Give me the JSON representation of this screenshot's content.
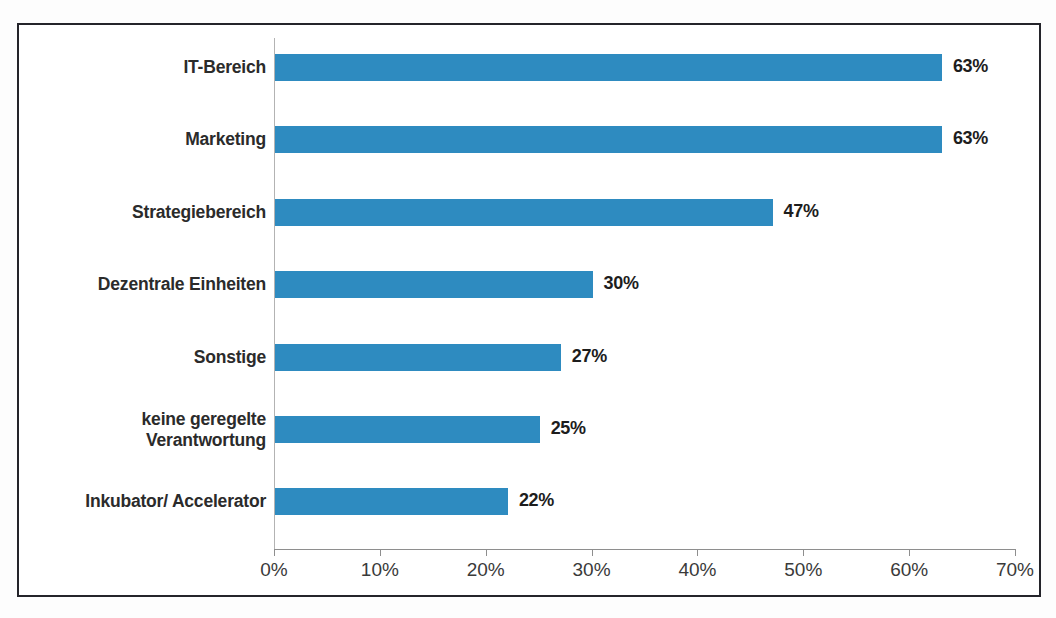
{
  "chart_data": {
    "type": "bar",
    "orientation": "horizontal",
    "title": "",
    "subtitle": "",
    "xlabel": "",
    "ylabel": "",
    "xlim": [
      0,
      70
    ],
    "grid": false,
    "legend": false,
    "bar_color": "#2e8bc0",
    "axis_color": "#8e8e8e",
    "frame_color": "#24242a",
    "value_suffix": "%",
    "categories": [
      "IT-Bereich",
      "Marketing",
      "Strategiebereich",
      "Dezentrale Einheiten",
      "Sonstige",
      "keine geregelte\nVerantwortung",
      "Inkubator/ Accelerator"
    ],
    "values": [
      63,
      63,
      47,
      30,
      27,
      25,
      22
    ],
    "value_labels": [
      "63%",
      "63%",
      "47%",
      "30%",
      "27%",
      "25%",
      "22%"
    ],
    "xticks": [
      0,
      10,
      20,
      30,
      40,
      50,
      60,
      70
    ],
    "xtick_labels": [
      "0%",
      "10%",
      "20%",
      "30%",
      "40%",
      "50%",
      "60%",
      "70%"
    ]
  },
  "rows": [
    {
      "label_line1": "IT-Bereich",
      "label_line2": "",
      "value_label": "63%"
    },
    {
      "label_line1": "Marketing",
      "label_line2": "",
      "value_label": "63%"
    },
    {
      "label_line1": "Strategiebereich",
      "label_line2": "",
      "value_label": "47%"
    },
    {
      "label_line1": "Dezentrale Einheiten",
      "label_line2": "",
      "value_label": "30%"
    },
    {
      "label_line1": "Sonstige",
      "label_line2": "",
      "value_label": "27%"
    },
    {
      "label_line1": "keine geregelte",
      "label_line2": "Verantwortung",
      "value_label": "25%"
    },
    {
      "label_line1": "Inkubator/ Accelerator",
      "label_line2": "",
      "value_label": "22%"
    }
  ],
  "axis": {
    "tick_labels": [
      "0%",
      "10%",
      "20%",
      "30%",
      "40%",
      "50%",
      "60%",
      "70%"
    ]
  }
}
